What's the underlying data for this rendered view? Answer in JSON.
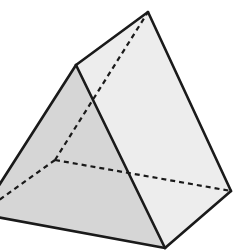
{
  "figure": {
    "width": 247,
    "height": 250,
    "colors": {
      "background": "#ffffff",
      "front_face": "#d6d6d6",
      "right_face": "#ededed",
      "edge": "#1a1a1a"
    },
    "vertices": {
      "top_back": [
        148,
        12
      ],
      "top_front": [
        76,
        65
      ],
      "right": [
        231,
        191
      ],
      "bottom_front": [
        165,
        248
      ],
      "hidden_back": [
        55,
        160
      ],
      "left_front_offscreen": [
        -20,
        215
      ]
    },
    "faces": {
      "front_face": "76,65 -20,215 165,248",
      "right_face": "76,65 148,12 231,191 165,248"
    },
    "edges_visible": [
      {
        "from": "top_front",
        "to": "top_back"
      },
      {
        "from": "top_back",
        "to": "right"
      },
      {
        "from": "right",
        "to": "bottom_front"
      },
      {
        "from": "top_front",
        "to": "bottom_front"
      },
      {
        "from": "top_front",
        "to": "left_front_offscreen"
      },
      {
        "from": "left_front_offscreen",
        "to": "bottom_front"
      }
    ],
    "edges_hidden": [
      {
        "from": "hidden_back",
        "to": "top_back"
      },
      {
        "from": "hidden_back",
        "to": "right"
      },
      {
        "from": "hidden_back",
        "to": "left_offscreen"
      }
    ]
  }
}
